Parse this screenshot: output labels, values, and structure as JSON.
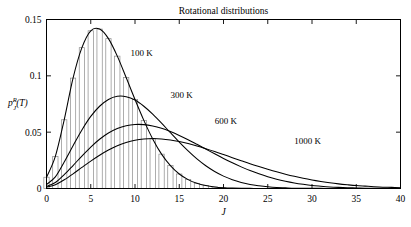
{
  "figure": {
    "title": "Rotational distributions",
    "xlabel": "J",
    "ylabel_base": "p",
    "ylabel_sup": "R",
    "ylabel_sub": "J",
    "ylabel_arg": "(T)",
    "frame_color": "#000000",
    "curve_color": "#000000",
    "bar_color": "#8a8a8a"
  },
  "axes": {
    "x_ticks": [
      "0",
      "5",
      "10",
      "15",
      "20",
      "25",
      "30",
      "35",
      "40"
    ],
    "y_ticks": [
      "0",
      "0.05",
      "0.1",
      "0.15"
    ]
  },
  "annotations": [
    {
      "text": "100 K",
      "x": 9.5,
      "y": 0.1175
    },
    {
      "text": "300 K",
      "x": 14.0,
      "y": 0.08
    },
    {
      "text": "600 K",
      "x": 19.0,
      "y": 0.057
    },
    {
      "text": "1000 K",
      "x": 28.0,
      "y": 0.0395
    }
  ],
  "chart_data": {
    "type": "line",
    "title": "Rotational distributions",
    "xlabel": "J",
    "ylabel": "p_J^R(T)",
    "xlim": [
      0,
      40
    ],
    "ylim": [
      0,
      0.15
    ],
    "grid": false,
    "legend": "inline-annotations",
    "x": [
      0,
      1,
      2,
      3,
      4,
      5,
      6,
      7,
      8,
      9,
      10,
      11,
      12,
      13,
      14,
      15,
      16,
      17,
      18,
      19,
      20,
      21,
      22,
      23,
      24,
      25,
      26,
      27,
      28,
      29,
      30,
      31,
      32,
      33,
      34,
      35,
      36,
      37,
      38,
      39,
      40
    ],
    "series": [
      {
        "name": "100 K",
        "peak_J": 4,
        "peak_value": 0.142,
        "has_histogram": true,
        "values": [
          0.01,
          0.0285,
          0.061,
          0.098,
          0.125,
          0.14,
          0.1415,
          0.133,
          0.1175,
          0.0985,
          0.079,
          0.0605,
          0.044,
          0.0305,
          0.0203,
          0.0129,
          0.0079,
          0.0046,
          0.0026,
          0.0014,
          0.0007,
          0.0004,
          0.0002,
          0.0001,
          0.0,
          0.0,
          0.0,
          0.0,
          0.0,
          0.0,
          0.0,
          0.0,
          0.0,
          0.0,
          0.0,
          0.0,
          0.0,
          0.0,
          0.0,
          0.0,
          0.0
        ]
      },
      {
        "name": "300 K",
        "peak_J": 7,
        "peak_value": 0.082,
        "has_histogram": false,
        "values": [
          0.0035,
          0.0103,
          0.0235,
          0.038,
          0.052,
          0.064,
          0.073,
          0.079,
          0.0818,
          0.0815,
          0.0785,
          0.073,
          0.066,
          0.058,
          0.0495,
          0.0412,
          0.0334,
          0.0263,
          0.0202,
          0.0151,
          0.011,
          0.0078,
          0.0054,
          0.0036,
          0.0024,
          0.0015,
          0.0009,
          0.0006,
          0.0003,
          0.0002,
          0.0001,
          0.0001,
          0.0,
          0.0,
          0.0,
          0.0,
          0.0,
          0.0,
          0.0,
          0.0,
          0.0
        ]
      },
      {
        "name": "600 K",
        "peak_J": 10,
        "peak_value": 0.057,
        "has_histogram": false,
        "values": [
          0.0018,
          0.0053,
          0.0123,
          0.0204,
          0.0288,
          0.0368,
          0.0437,
          0.0492,
          0.0532,
          0.0557,
          0.0568,
          0.0567,
          0.0555,
          0.0534,
          0.0505,
          0.0471,
          0.0433,
          0.0392,
          0.035,
          0.0308,
          0.0267,
          0.0228,
          0.0192,
          0.0159,
          0.013,
          0.0104,
          0.0082,
          0.0064,
          0.0049,
          0.0037,
          0.0027,
          0.002,
          0.0014,
          0.001,
          0.0007,
          0.0005,
          0.0003,
          0.0002,
          0.0001,
          0.0001,
          0.0001
        ]
      },
      {
        "name": "1000 K",
        "peak_J": 13,
        "peak_value": 0.0435,
        "has_histogram": false,
        "values": [
          0.0011,
          0.0033,
          0.0077,
          0.013,
          0.0187,
          0.0243,
          0.0295,
          0.0341,
          0.0379,
          0.0408,
          0.0428,
          0.0439,
          0.0443,
          0.044,
          0.0431,
          0.0417,
          0.0399,
          0.0377,
          0.0353,
          0.0328,
          0.0301,
          0.0274,
          0.0247,
          0.022,
          0.0195,
          0.0171,
          0.0148,
          0.0127,
          0.0108,
          0.0091,
          0.0076,
          0.0063,
          0.0051,
          0.0041,
          0.0033,
          0.0026,
          0.0021,
          0.0016,
          0.0012,
          0.001,
          0.0007
        ]
      }
    ]
  }
}
